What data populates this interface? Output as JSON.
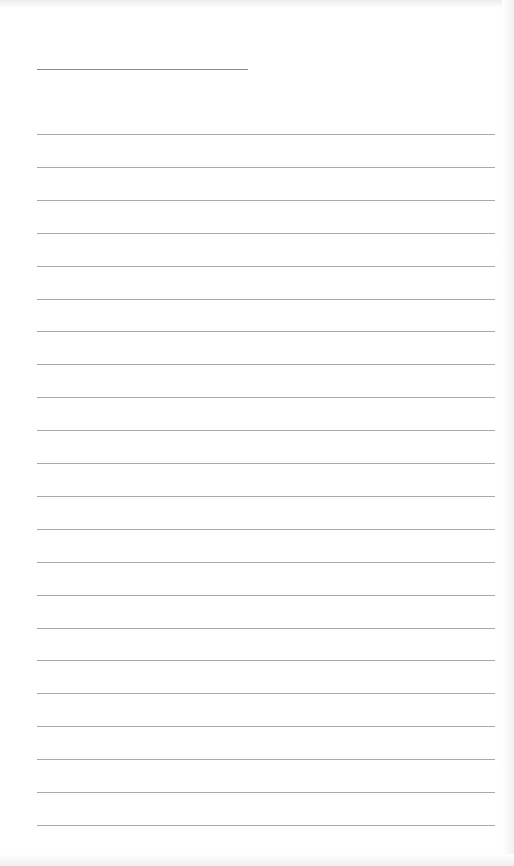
{
  "page": {
    "type": "lined notepaper",
    "background_color": "#ffffff",
    "line_color": "#a9a9a9",
    "title_line": {
      "x": 37,
      "y": 69,
      "width": 211,
      "text": ""
    },
    "rules": {
      "count": 22,
      "x": 37,
      "width": 458,
      "first_y": 134,
      "spacing": 32.9
    },
    "lines": [
      "",
      "",
      "",
      "",
      "",
      "",
      "",
      "",
      "",
      "",
      "",
      "",
      "",
      "",
      "",
      "",
      "",
      "",
      "",
      "",
      "",
      ""
    ]
  }
}
